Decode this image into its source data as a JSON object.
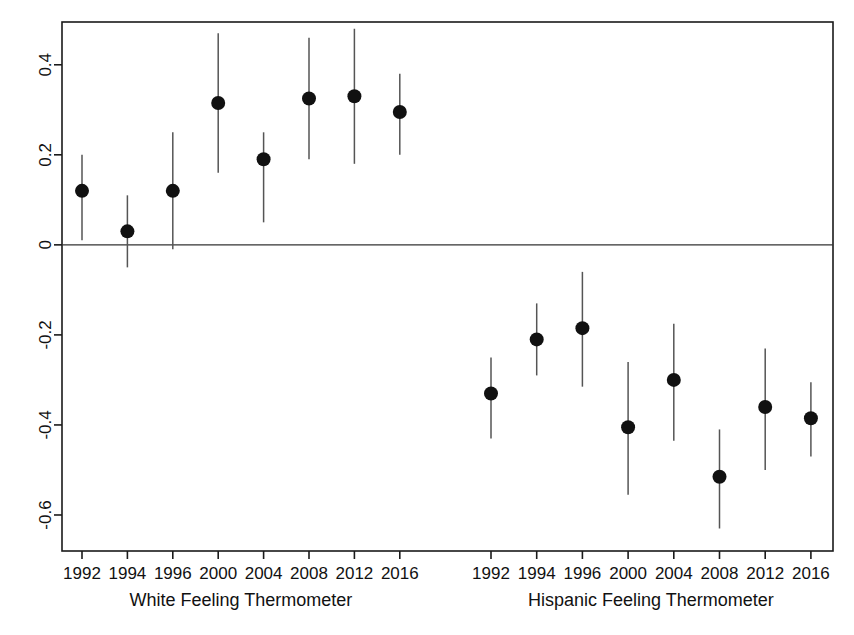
{
  "chart_data": {
    "type": "scatter",
    "title": "",
    "subtitle": "",
    "ylabel": "",
    "xlabel": "",
    "ylim": [
      -0.68,
      0.495
    ],
    "grid": false,
    "legend": null,
    "zero_line": 0,
    "y_ticks": [
      "0.4",
      "0.2",
      "0",
      "-0.2",
      "-0.4",
      "-0.6"
    ],
    "y_tick_values": [
      0.4,
      0.2,
      0,
      -0.2,
      -0.4,
      -0.6
    ],
    "panels": [
      {
        "name": "white-panel",
        "xlabel": "White Feeling Thermometer",
        "categories": [
          "1992",
          "1994",
          "1996",
          "2000",
          "2004",
          "2008",
          "2012",
          "2016"
        ],
        "values": [
          0.12,
          0.03,
          0.12,
          0.315,
          0.19,
          0.325,
          0.33,
          0.295
        ],
        "ci_low": [
          0.01,
          -0.05,
          -0.01,
          0.16,
          0.05,
          0.19,
          0.18,
          0.2
        ],
        "ci_high": [
          0.2,
          0.11,
          0.25,
          0.47,
          0.25,
          0.46,
          0.48,
          0.38
        ]
      },
      {
        "name": "hispanic-panel",
        "xlabel": "Hispanic Feeling Thermometer",
        "categories": [
          "1992",
          "1994",
          "1996",
          "2000",
          "2004",
          "2008",
          "2012",
          "2016"
        ],
        "values": [
          -0.33,
          -0.21,
          -0.185,
          -0.405,
          -0.3,
          -0.515,
          -0.36,
          -0.385
        ],
        "ci_low": [
          -0.43,
          -0.29,
          -0.315,
          -0.555,
          -0.435,
          -0.63,
          -0.5,
          -0.47
        ],
        "ci_high": [
          -0.25,
          -0.13,
          -0.06,
          -0.26,
          -0.175,
          -0.41,
          -0.23,
          -0.305
        ]
      }
    ],
    "colors": {
      "point": "#111111",
      "error_bar": "#555555",
      "axis": "#1a1a1a",
      "zero_line": "#333333",
      "background": "#ffffff"
    },
    "point_radius": 7
  },
  "figure": {
    "plot_box": {
      "left": 62,
      "right": 833,
      "top": 22,
      "bottom": 551
    }
  }
}
